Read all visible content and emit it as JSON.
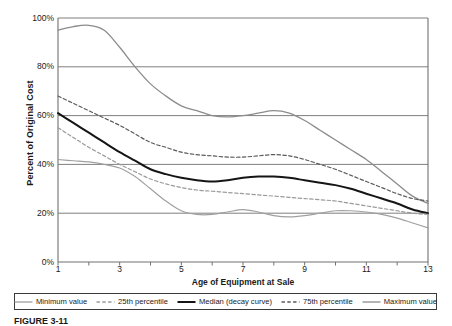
{
  "figure": {
    "caption": "FIGURE 3-11"
  },
  "chart_data": {
    "type": "line",
    "title": "",
    "xlabel": "Age of Equipment at Sale",
    "ylabel": "Percent of Original Cost",
    "xlim": [
      1,
      13
    ],
    "ylim": [
      0,
      100
    ],
    "grid": "horizontal",
    "legend_position": "bottom",
    "x_ticks": [
      1,
      2,
      3,
      4,
      5,
      6,
      7,
      8,
      9,
      10,
      11,
      12,
      13
    ],
    "x_tick_labels": [
      "1",
      "",
      "3",
      "",
      "5",
      "",
      "7",
      "",
      "9",
      "",
      "11",
      "",
      "13"
    ],
    "y_ticks": [
      0,
      20,
      40,
      60,
      80,
      100
    ],
    "y_tick_labels": [
      "0%",
      "20%",
      "40%",
      "60%",
      "80%",
      "100%"
    ],
    "x": [
      1,
      1.5,
      2,
      2.5,
      3,
      3.5,
      4,
      4.5,
      5,
      5.5,
      6,
      6.5,
      7,
      7.5,
      8,
      8.5,
      9,
      9.5,
      10,
      10.5,
      11,
      11.5,
      12,
      12.5,
      13
    ],
    "series": [
      {
        "name": "Maximum value",
        "style": "solid",
        "color": "#8c8c8c",
        "width": 1.3,
        "values": [
          95,
          96.5,
          97,
          95,
          88,
          80,
          73,
          68,
          64,
          62,
          60,
          59.5,
          60,
          61,
          62,
          61,
          58,
          54,
          50,
          46,
          42,
          37,
          32,
          27,
          24
        ]
      },
      {
        "name": "75th percentile",
        "style": "dashed",
        "color": "#5a5a5a",
        "width": 1.2,
        "values": [
          68,
          65,
          62,
          59,
          56,
          52.5,
          49,
          47,
          45,
          44,
          43.5,
          43,
          43,
          43.5,
          44,
          43.5,
          42,
          40,
          38,
          35.5,
          33,
          30.5,
          28,
          26,
          25
        ]
      },
      {
        "name": "Median (decay curve)",
        "style": "solid",
        "color": "#151515",
        "width": 2.0,
        "values": [
          61,
          57,
          53,
          49,
          45,
          41.5,
          38,
          36,
          34.5,
          33.5,
          33,
          33.5,
          34.5,
          35,
          35,
          34.5,
          33.5,
          32.5,
          31.5,
          30,
          28,
          26,
          24,
          21.5,
          20
        ]
      },
      {
        "name": "25th percentile",
        "style": "dashed",
        "color": "#9a9a9a",
        "width": 1.2,
        "values": [
          55,
          51,
          47,
          43.5,
          40,
          37,
          34,
          32,
          30.5,
          29.5,
          29,
          28.5,
          28,
          27.5,
          27,
          26.5,
          26,
          25.5,
          25,
          24,
          23,
          22,
          21,
          20,
          19.5
        ]
      },
      {
        "name": "Minimum value",
        "style": "solid",
        "color": "#a0a0a0",
        "width": 1.2,
        "values": [
          42,
          41.5,
          41,
          40,
          38.5,
          35,
          30,
          25,
          21,
          19.5,
          19.5,
          20.5,
          21.5,
          20.5,
          19,
          18.5,
          19,
          20,
          21,
          21,
          20.5,
          19.5,
          18,
          16,
          14
        ]
      }
    ]
  },
  "legend": {
    "items": [
      {
        "label": "Minimum value",
        "style": "solid",
        "color": "#a0a0a0"
      },
      {
        "label": "25th percentile",
        "style": "dashed",
        "color": "#9a9a9a"
      },
      {
        "label": "Median (decay curve)",
        "style": "solid",
        "color": "#151515"
      },
      {
        "label": "75th percentile",
        "style": "dashed",
        "color": "#5a5a5a"
      },
      {
        "label": "Maximum value",
        "style": "solid",
        "color": "#8c8c8c"
      }
    ]
  }
}
